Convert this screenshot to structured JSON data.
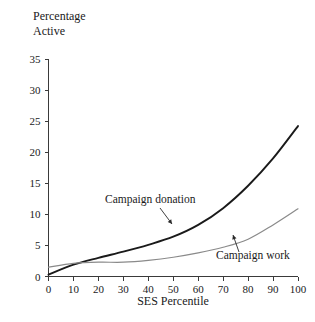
{
  "chart_data": {
    "type": "line",
    "title": "",
    "xlabel": "SES Percentile",
    "ylabel_line1": "Percentage",
    "ylabel_line2": "Active",
    "xlim": [
      0,
      100
    ],
    "ylim": [
      0,
      35
    ],
    "xticks": [
      "0",
      "10",
      "20",
      "30",
      "40",
      "50",
      "60",
      "70",
      "80",
      "90",
      "100"
    ],
    "yticks": [
      "0",
      "5",
      "10",
      "15",
      "20",
      "25",
      "30",
      "35"
    ],
    "grid": false,
    "legend_position": "inline-annotations",
    "x": [
      0,
      10,
      20,
      30,
      40,
      50,
      60,
      70,
      80,
      90,
      100
    ],
    "series": [
      {
        "name": "Campaign donation",
        "color": "#1a1a1a",
        "width": 1.9,
        "values": [
          0.3,
          1.9,
          3.0,
          4.0,
          5.1,
          6.4,
          8.3,
          11.0,
          14.6,
          19.0,
          24.2
        ]
      },
      {
        "name": "Campaign work",
        "color": "#8a8a8a",
        "width": 1.2,
        "values": [
          1.5,
          2.1,
          2.3,
          2.3,
          2.6,
          3.1,
          3.8,
          4.7,
          6.0,
          8.3,
          10.9
        ]
      }
    ],
    "annotations": [
      {
        "text": "Campaign donation",
        "label_x": 105,
        "label_y": 203,
        "leader_from_x": 160,
        "leader_from_y": 208,
        "leader_to_x": 172,
        "leader_to_y": 224
      },
      {
        "text": "Campaign work",
        "label_x": 216,
        "label_y": 259,
        "leader_from_x": 239,
        "leader_from_y": 252,
        "leader_to_x": 233,
        "leader_to_y": 235
      }
    ]
  }
}
